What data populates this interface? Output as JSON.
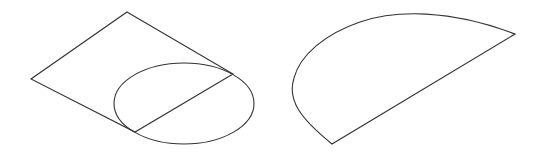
{
  "figure": {
    "width": 541,
    "height": 152,
    "background": "#ffffff",
    "stroke_color": "#333333",
    "shapes": [
      {
        "id": "left-figure",
        "description": "Parallelogram (isometric square) with an ellipse attached at its lower-right edge; the ellipse is bisected by the shared edge",
        "parallelogram_points": [
          [
            127,
            12
          ],
          [
            233,
            74
          ],
          [
            135,
            132
          ],
          [
            31,
            79
          ]
        ],
        "ellipse": {
          "cx": 184,
          "cy": 103.5,
          "rx": 70,
          "ry": 40.5
        },
        "chord": [
          [
            135,
            132
          ],
          [
            233,
            74
          ]
        ]
      },
      {
        "id": "right-figure",
        "description": "Half-ellipse (semicircle in oblique view) bounded by a straight diameter line",
        "chord": [
          [
            332,
            144
          ],
          [
            515,
            34
          ]
        ],
        "arc_points": [
          [
            332,
            144
          ],
          [
            293,
            88
          ],
          [
            323,
            38
          ],
          [
            390,
            13
          ],
          [
            470,
            18
          ],
          [
            515,
            34
          ]
        ]
      }
    ]
  }
}
